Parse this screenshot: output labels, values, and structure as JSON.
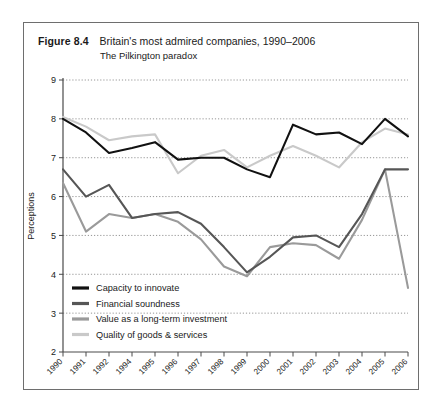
{
  "figure": {
    "number": "Figure 8.4",
    "title": "Britain's most admired companies, 1990–2006",
    "subtitle": "The Pilkington paradox"
  },
  "chart_data": {
    "type": "line",
    "title": "Britain's most admired companies, 1990–2006",
    "subtitle": "The Pilkington paradox",
    "xlabel": "",
    "ylabel": "Perceptions",
    "ylim": [
      2,
      9
    ],
    "yticks": [
      2,
      3,
      4,
      5,
      6,
      7,
      8,
      9
    ],
    "grid": "horizontal-dotted",
    "legend_position": "inside-lower-left",
    "categories": [
      "1990",
      "1991",
      "1992",
      "1994",
      "1995",
      "1996",
      "1997",
      "1998",
      "1999",
      "2000",
      "2001",
      "2002",
      "2003",
      "2004",
      "2005",
      "2006"
    ],
    "series": [
      {
        "name": "Capacity to innovate",
        "color": "#111111",
        "values": [
          8.0,
          7.65,
          7.12,
          7.25,
          7.4,
          6.95,
          7.0,
          7.0,
          6.7,
          6.5,
          7.85,
          7.6,
          7.65,
          7.35,
          8.0,
          7.55
        ]
      },
      {
        "name": "Financial soundness",
        "color": "#565656",
        "values": [
          6.7,
          6.0,
          6.3,
          5.45,
          5.55,
          5.6,
          5.3,
          4.7,
          4.05,
          4.45,
          4.95,
          5.0,
          4.7,
          5.55,
          6.7,
          6.7
        ]
      },
      {
        "name": "Value as a long-term investment",
        "color": "#9a9a9a",
        "values": [
          6.35,
          5.1,
          5.55,
          5.45,
          5.55,
          5.35,
          4.9,
          4.2,
          3.95,
          4.7,
          4.8,
          4.75,
          4.4,
          5.4,
          6.7,
          3.65
        ]
      },
      {
        "name": "Quality of goods & services",
        "color": "#c9c9c9",
        "values": [
          8.05,
          7.8,
          7.45,
          7.55,
          7.6,
          6.6,
          7.05,
          7.2,
          6.75,
          7.05,
          7.3,
          7.05,
          6.75,
          7.4,
          7.75,
          7.6
        ]
      }
    ]
  }
}
